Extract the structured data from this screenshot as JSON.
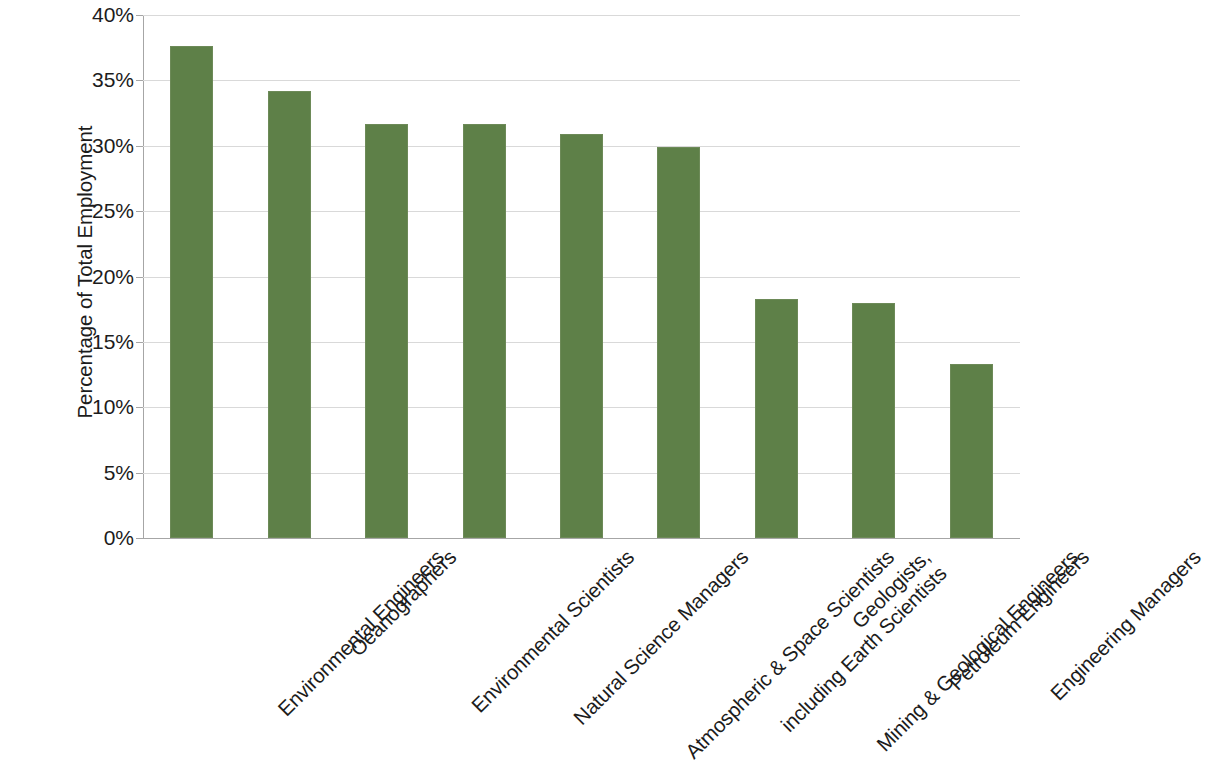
{
  "chart_data": {
    "type": "bar",
    "title": "",
    "xlabel": "",
    "ylabel": "Percentage of Total Employment",
    "ylim": [
      0,
      40
    ],
    "ytick_labels": [
      "40%",
      "35%",
      "30%",
      "25%",
      "20%",
      "15%",
      "10%",
      "5%",
      "0%"
    ],
    "ytick_values": [
      40,
      35,
      30,
      25,
      20,
      15,
      10,
      5,
      0
    ],
    "grid": true,
    "legend": "none",
    "bar_color": "#5e8048",
    "categories": [
      "Environmental Engineers",
      "Oeanographers",
      "Environmental Scientists",
      "Natural Science Managers",
      "Atmospheric & Space Scientists",
      "Geologists,\nincluding Earth Scientists",
      "Mining & Geological Engineers",
      "Petroleum Engineers",
      "Engineering Managers"
    ],
    "values": [
      37.6,
      34.2,
      31.7,
      31.7,
      30.9,
      29.9,
      18.3,
      18.0,
      13.3
    ]
  }
}
